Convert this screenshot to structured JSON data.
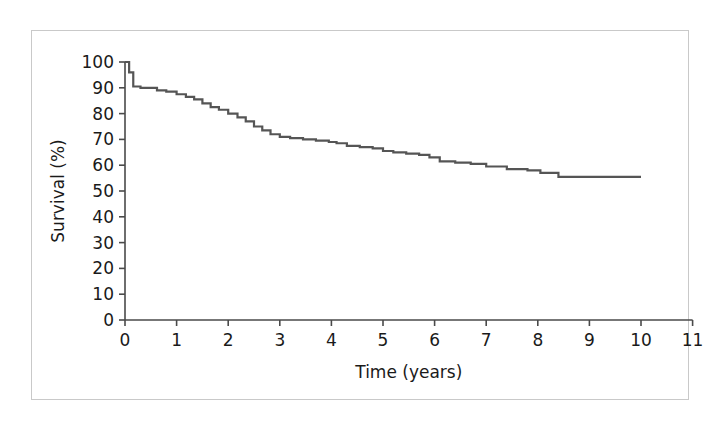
{
  "figure": {
    "background_color": "#ffffff",
    "border_color": "#c9c9c9"
  },
  "chart_data": {
    "type": "line",
    "subtype": "kaplan-meier-step",
    "title": "",
    "subtitle": "",
    "xlabel": "Time (years)",
    "ylabel": "Survival (%)",
    "xlim": [
      0,
      11
    ],
    "ylim": [
      0,
      100
    ],
    "xticks": [
      0,
      1,
      2,
      3,
      4,
      5,
      6,
      7,
      8,
      9,
      10,
      11
    ],
    "xtick_labels": [
      "0",
      "1",
      "2",
      "3",
      "4",
      "5",
      "6",
      "7",
      "8",
      "9",
      "10",
      "11"
    ],
    "yticks": [
      0,
      10,
      20,
      30,
      40,
      50,
      60,
      70,
      80,
      90,
      100
    ],
    "ytick_labels": [
      "0",
      "10",
      "20",
      "30",
      "40",
      "50",
      "60",
      "70",
      "80",
      "90",
      "100"
    ],
    "grid": false,
    "legend": false,
    "legend_position": "none",
    "line_color": "#555555",
    "line_width": 2.2,
    "series": [
      {
        "name": "Survival",
        "x": [
          0.0,
          0.08,
          0.16,
          0.3,
          0.45,
          0.62,
          0.8,
          1.0,
          1.18,
          1.34,
          1.5,
          1.66,
          1.82,
          2.0,
          2.18,
          2.34,
          2.5,
          2.66,
          2.82,
          3.0,
          3.2,
          3.45,
          3.7,
          3.95,
          4.1,
          4.3,
          4.55,
          4.8,
          5.0,
          5.2,
          5.45,
          5.7,
          5.9,
          6.1,
          6.4,
          6.7,
          7.0,
          7.4,
          7.8,
          8.05,
          8.4,
          9.0,
          9.5,
          10.0
        ],
        "y": [
          100.0,
          96.0,
          90.5,
          90.0,
          90.0,
          89.0,
          88.5,
          87.5,
          86.5,
          85.5,
          84.0,
          82.5,
          81.5,
          80.0,
          78.5,
          77.0,
          75.0,
          73.5,
          72.0,
          71.0,
          70.5,
          70.0,
          69.5,
          69.0,
          68.5,
          67.5,
          67.0,
          66.5,
          65.5,
          65.0,
          64.5,
          64.0,
          63.0,
          61.5,
          61.0,
          60.5,
          59.5,
          58.5,
          58.0,
          57.0,
          55.5,
          55.5,
          55.5,
          55.5
        ]
      }
    ]
  }
}
